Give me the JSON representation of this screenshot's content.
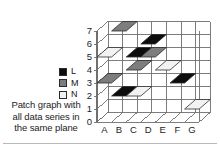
{
  "caption": {
    "line1": "Patch graph with",
    "line2": "all data series in",
    "line3": "the same plane"
  },
  "legend": {
    "items": [
      {
        "label": "L",
        "color": "#0d0d0d"
      },
      {
        "label": "M",
        "color": "#7d7d7d"
      },
      {
        "label": "N",
        "color": "#f2f2f2"
      }
    ]
  },
  "chart_data": {
    "type": "heatmap",
    "title": "Patch graph with all data series in the same plane",
    "xlabel": "",
    "ylabel": "",
    "categories": [
      "A",
      "B",
      "C",
      "D",
      "E",
      "F",
      "G"
    ],
    "y_ticks": [
      "0",
      "1",
      "2",
      "3",
      "4",
      "5",
      "6",
      "7"
    ],
    "ylim": [
      0,
      7
    ],
    "grid": true,
    "legend_position": "left",
    "projection": "3d-oblique-single-plane",
    "series": [
      {
        "name": "L",
        "color": "#0d0d0d",
        "patches": [
          {
            "x": "D",
            "y": 6
          },
          {
            "x": "C",
            "y": 5
          },
          {
            "x": "F",
            "y": 3
          },
          {
            "x": "B",
            "y": 2
          }
        ]
      },
      {
        "name": "M",
        "color": "#7d7d7d",
        "patches": [
          {
            "x": "B",
            "y": 7
          },
          {
            "x": "D",
            "y": 5
          },
          {
            "x": "C",
            "y": 4
          },
          {
            "x": "A",
            "y": 3
          }
        ]
      },
      {
        "name": "N",
        "color": "#f2f2f2",
        "patches": [
          {
            "x": "A",
            "y": 5
          },
          {
            "x": "E",
            "y": 4
          },
          {
            "x": "C",
            "y": 2
          },
          {
            "x": "G",
            "y": 1
          }
        ]
      }
    ]
  }
}
